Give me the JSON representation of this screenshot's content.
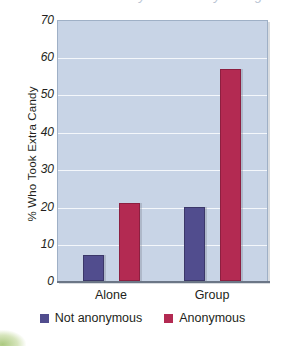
{
  "chart_data": {
    "type": "bar",
    "title": "",
    "xlabel": "",
    "ylabel": "% Who Took Extra Candy",
    "categories": [
      "Alone",
      "Group"
    ],
    "series": [
      {
        "name": "Not anonymous",
        "color": "#514d8e",
        "values": [
          7,
          20
        ]
      },
      {
        "name": "Anonymous",
        "color": "#b32a52",
        "values": [
          21,
          57
        ]
      }
    ],
    "ylim": [
      0,
      70
    ],
    "yticks": [
      0,
      10,
      20,
      30,
      40,
      50,
      60,
      70
    ],
    "ytick_labels": [
      "0",
      "10",
      "20",
      "30",
      "40",
      "50",
      "60",
      "70"
    ],
    "grid": true,
    "grid_axis": "y",
    "legend_position": "bottom",
    "plot_background": "#c8d4e6",
    "gridline_color": "#f4f7fb",
    "axis_color": "#6b7686"
  },
  "legend": {
    "items": [
      {
        "label": "Not anonymous",
        "color": "#514d8e"
      },
      {
        "label": "Anonymous",
        "color": "#b32a52"
      }
    ]
  },
  "axes": {
    "y_title": "% Who Took Extra Candy",
    "y_labels": [
      "70",
      "60",
      "50",
      "40",
      "30",
      "20",
      "10",
      "0"
    ],
    "x_labels": [
      "Alone",
      "Group"
    ]
  },
  "title_remnant": "clipped title"
}
